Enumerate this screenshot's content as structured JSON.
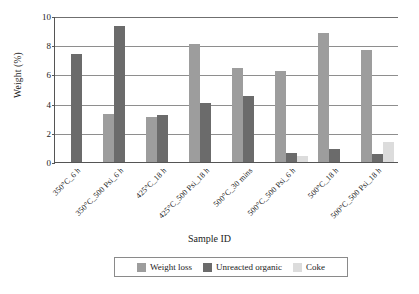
{
  "chart_data": {
    "type": "bar",
    "title": "",
    "xlabel": "Sample ID",
    "ylabel": "Weight (%)",
    "ylim": [
      0,
      10
    ],
    "yticks": [
      0,
      2,
      4,
      6,
      8,
      10
    ],
    "ytick_labels": [
      "0",
      "2",
      "4",
      "6",
      "8",
      "10"
    ],
    "grid": true,
    "legend_position": "bottom",
    "categories": [
      "350°C_6 h",
      "350°C_500 Psi_6 h",
      "425°C_18 h",
      "425°C_500 Psi_18 h",
      "500°C_30 mins",
      "500°C_500 Psi_6 h",
      "500°C_18 h",
      "500°C_500 Psi_18 h"
    ],
    "series": [
      {
        "name": "Weight loss",
        "color": "#9d9d9d",
        "values": [
          null,
          3.3,
          3.1,
          8.05,
          6.45,
          6.2,
          8.85,
          7.7
        ]
      },
      {
        "name": "Unreacted organic",
        "color": "#6b6b6b",
        "values": [
          7.4,
          9.35,
          3.25,
          4.05,
          4.5,
          0.6,
          0.9,
          0.55
        ]
      },
      {
        "name": "Coke",
        "color": "#dcdcdc",
        "values": [
          null,
          null,
          null,
          null,
          null,
          0.4,
          null,
          1.35
        ]
      }
    ]
  }
}
